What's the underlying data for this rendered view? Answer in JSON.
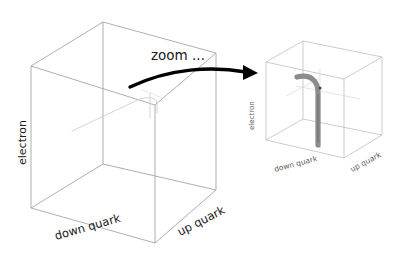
{
  "figure": {
    "background_color": "#ffffff",
    "annotation": {
      "text": "zoom ...",
      "color": "#1a1a1a"
    },
    "arrow": {
      "name": "zoom-arrow",
      "color": "#000000",
      "direction": "left-to-right-curved"
    },
    "panels": [
      {
        "id": "left-cube",
        "role": "overview",
        "wire_color": "#9a9a9a",
        "axes": {
          "vertical": "electron",
          "front_left": "down quark",
          "front_right": "up quark"
        },
        "content": {
          "name": "faint-trajectory",
          "color": "#cccccc",
          "description": "very faint small hooked trajectory near centre"
        }
      },
      {
        "id": "right-cube",
        "role": "zoomed-detail",
        "wire_color": "#b4b4b4",
        "axes": {
          "vertical": "electron",
          "front_left": "down quark",
          "front_right": "up quark"
        },
        "content": {
          "name": "gray-trajectory",
          "color": "#8c8c8c",
          "description": "thick grey vertical line bending into a horizontal hook at the top"
        }
      }
    ]
  }
}
